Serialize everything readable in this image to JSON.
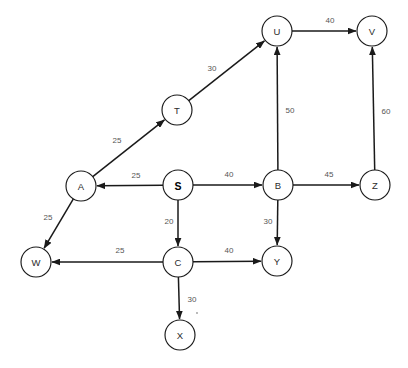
{
  "diagram": {
    "type": "directed-weighted-graph",
    "node_radius": 15,
    "colors": {
      "background": "#ffffff",
      "stroke": "#1a1a1a",
      "node_fill": "#ffffff",
      "label_text": "#2b2b2b",
      "weight_text": "#555555"
    },
    "nodes": [
      {
        "id": "U",
        "label": "U",
        "x": 277,
        "y": 31,
        "bold": false
      },
      {
        "id": "V",
        "label": "V",
        "x": 372,
        "y": 31,
        "bold": false
      },
      {
        "id": "T",
        "label": "T",
        "x": 177,
        "y": 110,
        "bold": false
      },
      {
        "id": "A",
        "label": "A",
        "x": 81,
        "y": 186,
        "bold": false
      },
      {
        "id": "S",
        "label": "S",
        "x": 178,
        "y": 185,
        "bold": true
      },
      {
        "id": "B",
        "label": "B",
        "x": 278,
        "y": 185,
        "bold": false
      },
      {
        "id": "Z",
        "label": "Z",
        "x": 375,
        "y": 185,
        "bold": false
      },
      {
        "id": "W",
        "label": "W",
        "x": 36,
        "y": 262,
        "bold": false
      },
      {
        "id": "C",
        "label": "C",
        "x": 178,
        "y": 262,
        "bold": false
      },
      {
        "id": "Y",
        "label": "Y",
        "x": 277,
        "y": 261,
        "bold": false
      },
      {
        "id": "X",
        "label": "X",
        "x": 180,
        "y": 335,
        "bold": false
      }
    ],
    "edges": [
      {
        "from": "T",
        "to": "U",
        "weight": "30",
        "label_x": 212,
        "label_y": 68
      },
      {
        "from": "U",
        "to": "V",
        "weight": "40",
        "label_x": 330,
        "label_y": 20
      },
      {
        "from": "B",
        "to": "U",
        "weight": "50",
        "label_x": 290,
        "label_y": 110
      },
      {
        "from": "Z",
        "to": "V",
        "weight": "60",
        "label_x": 386,
        "label_y": 111
      },
      {
        "from": "A",
        "to": "T",
        "weight": "25",
        "label_x": 117,
        "label_y": 140
      },
      {
        "from": "S",
        "to": "A",
        "weight": "25",
        "label_x": 136,
        "label_y": 175
      },
      {
        "from": "S",
        "to": "B",
        "weight": "40",
        "label_x": 229,
        "label_y": 174
      },
      {
        "from": "S",
        "to": "C",
        "weight": "20",
        "label_x": 169,
        "label_y": 221
      },
      {
        "from": "B",
        "to": "Z",
        "weight": "45",
        "label_x": 329,
        "label_y": 174
      },
      {
        "from": "B",
        "to": "Y",
        "weight": "30",
        "label_x": 268,
        "label_y": 221
      },
      {
        "from": "A",
        "to": "W",
        "weight": "25",
        "label_x": 48,
        "label_y": 217
      },
      {
        "from": "C",
        "to": "W",
        "weight": "25",
        "label_x": 120,
        "label_y": 250
      },
      {
        "from": "C",
        "to": "Y",
        "weight": "40",
        "label_x": 229,
        "label_y": 250
      },
      {
        "from": "C",
        "to": "X",
        "weight": "30",
        "label_x": 192,
        "label_y": 299
      }
    ]
  }
}
